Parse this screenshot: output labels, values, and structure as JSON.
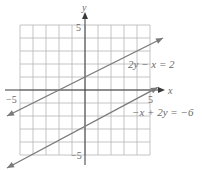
{
  "chart_data": {
    "type": "line",
    "title": "",
    "xlabel": "x",
    "ylabel": "y",
    "xlim": [
      -5,
      5
    ],
    "ylim": [
      -5,
      5
    ],
    "grid": true,
    "tick_labels": {
      "x_neg": "−5",
      "x_pos": "5",
      "y_pos": "5",
      "y_neg": "−5"
    },
    "series": [
      {
        "name": "2y − x = 2",
        "equation": "y = x/2 + 1",
        "slope": 0.5,
        "intercept": 1,
        "x": [
          -6.0,
          6.0
        ],
        "values": [
          -2.0,
          4.0
        ]
      },
      {
        "name": "−x + 2y = −6",
        "equation": "y = x/2 - 3",
        "slope": 0.5,
        "intercept": -3,
        "x": [
          -6.0,
          5.6
        ],
        "values": [
          -6.0,
          0.2
        ]
      }
    ],
    "annotations": [
      "2y − x = 2",
      "−x + 2y = −6"
    ]
  },
  "colors": {
    "grid": "#b5b5b5",
    "axis": "#3a3a3a",
    "line": "#7a7a7a",
    "text": "#6a6a6a"
  }
}
